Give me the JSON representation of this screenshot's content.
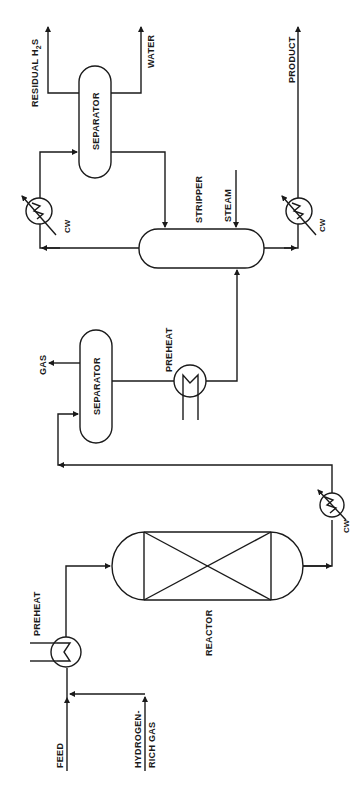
{
  "diagram": {
    "orientation": "rotated-90-ccw",
    "colors": {
      "line": "#1a1a1a",
      "background": "#ffffff"
    },
    "inputs": {
      "feed": "FEED",
      "hydrogen_line1": "HYDROGEN-",
      "hydrogen_line2": "RICH GAS",
      "steam": "STEAM"
    },
    "equipment": {
      "preheat1": "PREHEAT",
      "reactor": "REACTOR",
      "cooler1": "CW",
      "separator1": "SEPARATOR",
      "preheat2": "PREHEAT",
      "stripper": "STRIPPER",
      "cooler2": "CW",
      "separator2": "SEPARATOR",
      "cooler3": "CW"
    },
    "outputs": {
      "gas": "GAS",
      "residual_h2s_prefix": "RESIDUAL  H",
      "residual_h2s_sub": "2",
      "residual_h2s_suffix": "S",
      "water": "WATER",
      "product": "PRODUCT"
    }
  }
}
